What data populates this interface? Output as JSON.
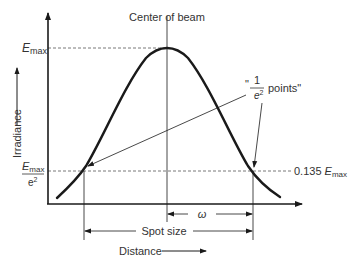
{
  "diagram": {
    "labels": {
      "center": "Center of beam",
      "emax_main": "E",
      "emax_sub": "max",
      "y_axis": "Irradiance",
      "x_axis": "Distance",
      "emin_num_main": "E",
      "emin_num_sub": "max",
      "emin_den": "e",
      "emin_den_sup": "2",
      "right_value_prefix": "0.135 ",
      "right_value_main": "E",
      "right_value_sub": "max",
      "points_quote_open": "\"",
      "points_num": "1",
      "points_den": "e",
      "points_den_sup": "2",
      "points_text": "points\"",
      "omega": "ω",
      "spot_size": "Spot size"
    },
    "colors": {
      "stroke": "#1a1a1a",
      "text": "#333333"
    }
  }
}
